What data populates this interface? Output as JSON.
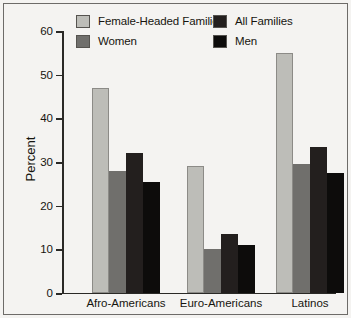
{
  "chart_data": {
    "type": "bar",
    "title": "",
    "subtitle": "",
    "xlabel": "",
    "ylabel": "Percent",
    "categories": [
      "Afro-Americans",
      "Euro-Americans",
      "Latinos"
    ],
    "series": [
      {
        "name": "Female-Headed Families",
        "color": "#bdbdb8",
        "values": [
          47,
          29,
          55
        ]
      },
      {
        "name": "Women",
        "color": "#706f6c",
        "values": [
          28,
          10,
          29.5
        ]
      },
      {
        "name": "All Families",
        "color": "#231f1e",
        "values": [
          32,
          13.5,
          33.5
        ]
      },
      {
        "name": "Men",
        "color": "#0d0c0b",
        "values": [
          25.5,
          11,
          27.5
        ]
      }
    ],
    "ylim": [
      0,
      60
    ],
    "yticks": [
      0,
      10,
      20,
      30,
      40,
      50,
      60
    ],
    "ytick_labels": [
      "0",
      "10",
      "20",
      "30",
      "40",
      "50",
      "60"
    ],
    "grid": false,
    "legend_position": "top",
    "units": "percent"
  },
  "legend": {
    "items": [
      {
        "label": "Female-Headed Families",
        "color": "#bdbdb8"
      },
      {
        "label": "All Families",
        "color": "#231f1e"
      },
      {
        "label": "Women",
        "color": "#706f6c"
      },
      {
        "label": "Men",
        "color": "#0d0c0b"
      }
    ]
  },
  "axes": {
    "y_label": "Percent",
    "y_ticks": [
      "60",
      "50",
      "40",
      "30",
      "20",
      "10",
      "0"
    ],
    "x_categories": [
      "Afro-Americans",
      "Euro-Americans",
      "Latinos"
    ]
  }
}
